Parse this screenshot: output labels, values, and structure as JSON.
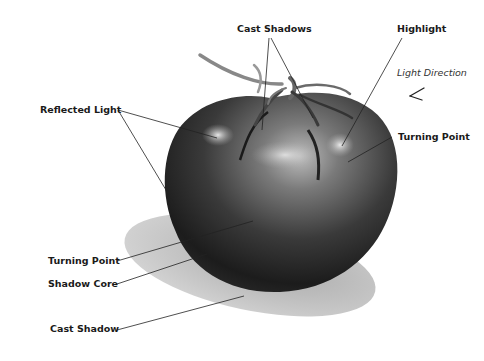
{
  "diagram": {
    "labels": [
      {
        "id": "cast-shadows",
        "text": "Cast Shadows",
        "x": 237,
        "y": 32,
        "anchor": "start"
      },
      {
        "id": "highlight",
        "text": "Highlight",
        "x": 397,
        "y": 32,
        "anchor": "start"
      },
      {
        "id": "light-direction",
        "text": "Light Direction",
        "x": 397,
        "y": 76,
        "anchor": "start",
        "style": "italic"
      },
      {
        "id": "reflected-light",
        "text": "Reflected Light",
        "x": 40,
        "y": 113,
        "anchor": "start"
      },
      {
        "id": "turning-point-right",
        "text": "Turning Point",
        "x": 398,
        "y": 140,
        "anchor": "start"
      },
      {
        "id": "turning-point-left",
        "text": "Turning Point",
        "x": 48,
        "y": 264,
        "anchor": "start"
      },
      {
        "id": "shadow-core",
        "text": "Shadow Core",
        "x": 48,
        "y": 287,
        "anchor": "start"
      },
      {
        "id": "cast-shadow",
        "text": "Cast Shadow",
        "x": 50,
        "y": 332,
        "anchor": "start"
      }
    ],
    "leaders": [
      {
        "id": "cast-shadows-a",
        "x1": 269,
        "y1": 38,
        "x2": 262,
        "y2": 130
      },
      {
        "id": "cast-shadows-b",
        "x1": 271,
        "y1": 38,
        "x2": 313,
        "y2": 118
      },
      {
        "id": "highlight",
        "x1": 402,
        "y1": 38,
        "x2": 342,
        "y2": 146
      },
      {
        "id": "reflected-light-a",
        "x1": 118,
        "y1": 110,
        "x2": 217,
        "y2": 138
      },
      {
        "id": "reflected-light-b",
        "x1": 118,
        "y1": 110,
        "x2": 175,
        "y2": 205
      },
      {
        "id": "turning-point-right",
        "x1": 392,
        "y1": 137,
        "x2": 348,
        "y2": 162
      },
      {
        "id": "turning-point-left",
        "x1": 117,
        "y1": 261,
        "x2": 253,
        "y2": 221
      },
      {
        "id": "shadow-core",
        "x1": 117,
        "y1": 284,
        "x2": 207,
        "y2": 254
      },
      {
        "id": "cast-shadow",
        "x1": 117,
        "y1": 330,
        "x2": 244,
        "y2": 296
      }
    ],
    "arrow": {
      "name": "light-direction-arrow",
      "from": [
        421,
        95
      ],
      "to": [
        410,
        100
      ]
    },
    "colors": {
      "background": "#ffffff",
      "text": "#1a1a1a",
      "tomato_dark": "#1e1e1e",
      "tomato_mid": "#555555",
      "highlight": "#d8d8d8",
      "cast_shadow": "#b4b4b4"
    }
  }
}
